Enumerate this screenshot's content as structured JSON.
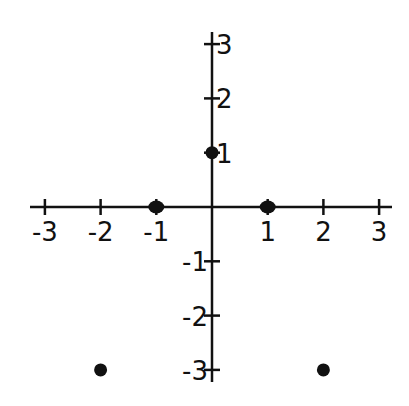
{
  "chart_data": {
    "type": "scatter",
    "title": "",
    "xlabel": "",
    "ylabel": "",
    "xlim": [
      -3,
      3
    ],
    "ylim": [
      -3,
      3
    ],
    "grid": false,
    "x_ticks": [
      "-3",
      "-2",
      "-1",
      "1",
      "2",
      "3"
    ],
    "y_ticks": [
      "3",
      "2",
      "1",
      "-1",
      "-2",
      "-3"
    ],
    "points": [
      {
        "x": -2,
        "y": -3
      },
      {
        "x": -1,
        "y": 0
      },
      {
        "x": 0,
        "y": 1
      },
      {
        "x": 1,
        "y": 0
      },
      {
        "x": 2,
        "y": -3
      }
    ]
  },
  "colors": {
    "axis": "#111111",
    "point": "#111111"
  }
}
